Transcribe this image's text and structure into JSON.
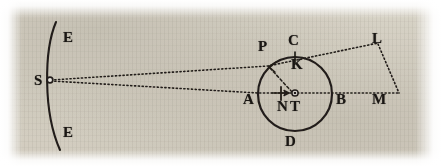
{
  "figure": {
    "ink_color": "#1f1b16",
    "paper_color": "#e9e6df"
  },
  "labels": [
    {
      "id": "E-top",
      "text": "E",
      "x": 63,
      "y": 30,
      "name": "point-label-e-top"
    },
    {
      "id": "S",
      "text": "S",
      "x": 34,
      "y": 73,
      "name": "point-label-s"
    },
    {
      "id": "E-bottom",
      "text": "E",
      "x": 63,
      "y": 125,
      "name": "point-label-e-bottom"
    },
    {
      "id": "P",
      "text": "P",
      "x": 258,
      "y": 39,
      "name": "point-label-p"
    },
    {
      "id": "C",
      "text": "C",
      "x": 288,
      "y": 33,
      "name": "point-label-c"
    },
    {
      "id": "L",
      "text": "L",
      "x": 372,
      "y": 31,
      "name": "point-label-l"
    },
    {
      "id": "K",
      "text": "K",
      "x": 291,
      "y": 57,
      "name": "point-label-k"
    },
    {
      "id": "A",
      "text": "A",
      "x": 243,
      "y": 92,
      "name": "point-label-a"
    },
    {
      "id": "N",
      "text": "N",
      "x": 277,
      "y": 99,
      "name": "point-label-n"
    },
    {
      "id": "T",
      "text": "T",
      "x": 290,
      "y": 99,
      "name": "point-label-t"
    },
    {
      "id": "B",
      "text": "B",
      "x": 336,
      "y": 92,
      "name": "point-label-b"
    },
    {
      "id": "M",
      "text": "M",
      "x": 372,
      "y": 92,
      "name": "point-label-m"
    },
    {
      "id": "D",
      "text": "D",
      "x": 285,
      "y": 134,
      "name": "point-label-d"
    }
  ],
  "geometry": {
    "arc_ee": {
      "start_x": 56,
      "start_y": 22,
      "end_x": 60,
      "end_y": 150,
      "bulge_x": 44,
      "bulge_y": 86
    },
    "point_s": {
      "x": 50,
      "y": 80,
      "marker": "open-circle"
    },
    "circle": {
      "cx": 295,
      "cy": 94,
      "r": 37
    },
    "point_p": {
      "x": 268,
      "y": 66,
      "marker": "arrowhead"
    },
    "point_t": {
      "x": 295,
      "y": 94,
      "marker": "dot-in-circle"
    },
    "tick_n": {
      "x": 281,
      "y": 94,
      "length": 12,
      "orientation": "vertical"
    },
    "tick_c": {
      "x": 295,
      "y": 57,
      "length": 11,
      "orientation": "vertical"
    },
    "point_l": {
      "x": 378,
      "y": 43
    },
    "point_m": {
      "x": 399,
      "y": 93
    },
    "line_s_to_p_l": {
      "style": "dotted",
      "from": "S",
      "through": "P",
      "to": "L"
    },
    "line_s_to_a_b_m": {
      "style": "dotted",
      "from": "S",
      "through": "A, N, T, B",
      "to": "M"
    },
    "line_l_to_m": {
      "style": "dotted",
      "from": "L",
      "to": "M"
    },
    "line_p_to_t": {
      "style": "dashed",
      "from": "P",
      "to": "T"
    }
  }
}
